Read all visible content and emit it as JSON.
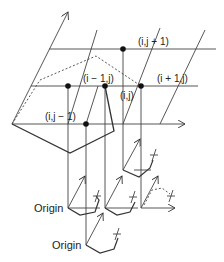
{
  "diagram": {
    "node_labels": {
      "top": "(i,j + 1)",
      "left_mid": "(i − 1,j)",
      "center": "(i,j)",
      "right_mid": "(i + 1,j)",
      "bottom": "(i,j − 1)"
    },
    "origin_labels": [
      "Origin",
      "Origin"
    ],
    "colors": {
      "line": "#333333",
      "node": "#111111",
      "background": "#ffffff"
    }
  }
}
